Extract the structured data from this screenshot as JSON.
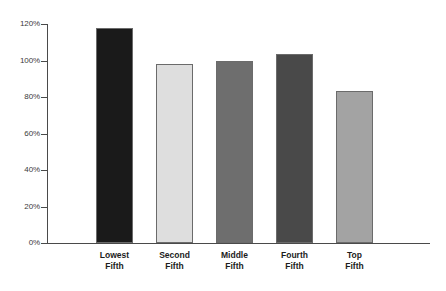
{
  "chart_data": {
    "type": "bar",
    "title": "",
    "subtitle": "",
    "xlabel": "",
    "ylabel": "",
    "categories": [
      "Lowest Fifth",
      "Second Fifth",
      "Middle Fifth",
      "Fourth Fifth",
      "Top Fifth"
    ],
    "category_lines": [
      [
        "Lowest",
        "Fifth"
      ],
      [
        "Second",
        "Fifth"
      ],
      [
        "Middle",
        "Fifth"
      ],
      [
        "Fourth",
        "Fifth"
      ],
      [
        "Top",
        "Fifth"
      ]
    ],
    "values": [
      117.8,
      98.0,
      99.7,
      103.6,
      83.3
    ],
    "value_labels": [
      "",
      "",
      "",
      "",
      ""
    ],
    "ylim": [
      0,
      120
    ],
    "ytick_values": [
      0,
      20,
      40,
      60,
      80,
      100,
      120
    ],
    "ytick_labels": [
      "0%",
      "20%",
      "40%",
      "60%",
      "80%",
      "100%",
      "120%"
    ],
    "grid": false,
    "legend": null,
    "bar_colors": [
      "#1a1a1a",
      "#dedede",
      "#6e6e6e",
      "#494949",
      "#a3a3a3"
    ],
    "bar_border_color": "#6b6b6b",
    "axis_color": "#4a4a4a",
    "background_color": "#ffffff"
  }
}
